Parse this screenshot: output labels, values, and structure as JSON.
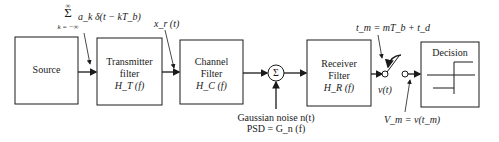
{
  "diagram": {
    "blocks": {
      "source": {
        "label": "Source"
      },
      "transmitter": {
        "line1": "Transmitter",
        "line2": "filter",
        "tf": "H_T (f)"
      },
      "channel": {
        "line1": "Channel",
        "line2": "Filter",
        "tf": "H_C (f)"
      },
      "summer": {
        "symbol": "Σ"
      },
      "receiver": {
        "line1": "Receiver",
        "line2": "Filter",
        "tf": "H_R (f)"
      },
      "decision": {
        "label": "Decision"
      }
    },
    "annotations": {
      "input_sum": {
        "sigma": "Σ",
        "upper": "∞",
        "lower": "k = −∞",
        "expr": "a_k δ(t − kT_b)"
      },
      "xr": "x_r (t)",
      "noise_line1": "Gaussian noise n(t)",
      "noise_line2": "PSD = G_n (f)",
      "sample_time": "t_m = mT_b + t_d",
      "vt": "v(t)",
      "vm": "V_m = v(t_m)"
    },
    "colors": {
      "stroke": "#1a1a1a",
      "background": "#ffffff"
    }
  }
}
